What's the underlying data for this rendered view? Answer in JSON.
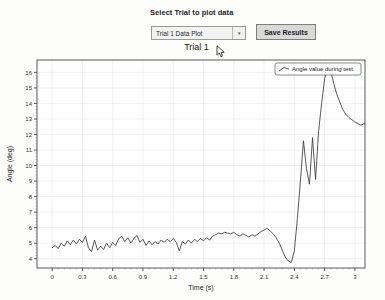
{
  "panel": {
    "select_label": "Select Trial to plot data",
    "dropdown_value": "Trial 1 Data Plot",
    "dropdown_arrow": "▾",
    "save_button_label": "Save Results"
  },
  "chart_data": {
    "type": "line",
    "title": "Trial 1",
    "xlabel": "Time (s)",
    "ylabel": "Angle (deg)",
    "xlim": [
      -0.15,
      3.1
    ],
    "ylim": [
      3.4,
      16.8
    ],
    "xticks": [
      0,
      0.3,
      0.6,
      0.9,
      1.2,
      1.5,
      1.8,
      2.1,
      2.4,
      2.7,
      3
    ],
    "xtick_labels": [
      "0",
      "0.3",
      "0.6",
      "0.9",
      "1.2",
      "1.5",
      "1.8",
      "2.1",
      "2.4",
      "2.7",
      "3"
    ],
    "yticks": [
      4,
      5,
      6,
      7,
      8,
      9,
      10,
      11,
      12,
      13,
      14,
      15,
      16
    ],
    "ytick_labels": [
      "4",
      "5",
      "6",
      "7",
      "8",
      "9",
      "10",
      "11",
      "12",
      "13",
      "14",
      "15",
      "16"
    ],
    "grid": true,
    "legend_position": "top-right",
    "series": [
      {
        "name": "Angle value during test",
        "color": "#3a3a3a",
        "x": [
          0.0,
          0.03,
          0.06,
          0.09,
          0.12,
          0.15,
          0.18,
          0.21,
          0.24,
          0.27,
          0.3,
          0.33,
          0.36,
          0.39,
          0.42,
          0.45,
          0.48,
          0.51,
          0.54,
          0.57,
          0.6,
          0.63,
          0.66,
          0.69,
          0.72,
          0.75,
          0.78,
          0.81,
          0.84,
          0.87,
          0.9,
          0.93,
          0.96,
          0.99,
          1.02,
          1.05,
          1.08,
          1.11,
          1.14,
          1.17,
          1.2,
          1.23,
          1.26,
          1.29,
          1.32,
          1.35,
          1.38,
          1.41,
          1.44,
          1.47,
          1.5,
          1.53,
          1.56,
          1.59,
          1.62,
          1.65,
          1.68,
          1.71,
          1.74,
          1.77,
          1.8,
          1.83,
          1.86,
          1.89,
          1.92,
          1.95,
          1.98,
          2.01,
          2.04,
          2.07,
          2.1,
          2.13,
          2.16,
          2.19,
          2.22,
          2.25,
          2.28,
          2.31,
          2.34,
          2.37,
          2.4,
          2.43,
          2.46,
          2.49,
          2.52,
          2.55,
          2.58,
          2.61,
          2.64,
          2.67,
          2.7,
          2.73,
          2.76,
          2.79,
          2.82,
          2.85,
          2.88,
          2.91,
          2.94,
          2.97,
          3.0
        ],
        "y": [
          4.7,
          4.85,
          4.65,
          5.0,
          4.8,
          5.15,
          4.9,
          5.2,
          4.95,
          5.25,
          5.05,
          5.45,
          4.7,
          4.45,
          5.2,
          4.55,
          4.8,
          4.6,
          5.0,
          4.7,
          5.05,
          4.85,
          5.3,
          5.45,
          5.1,
          5.35,
          5.0,
          5.3,
          5.5,
          5.05,
          5.25,
          4.85,
          5.15,
          4.9,
          5.1,
          4.95,
          5.2,
          5.05,
          5.25,
          5.1,
          5.3,
          5.05,
          4.5,
          5.1,
          4.95,
          5.2,
          5.0,
          5.25,
          5.1,
          5.3,
          5.15,
          5.35,
          5.2,
          5.45,
          5.55,
          5.65,
          5.6,
          5.7,
          5.65,
          5.6,
          5.7,
          5.55,
          5.45,
          5.6,
          5.5,
          5.4,
          5.55,
          5.45,
          5.6,
          5.75,
          5.85,
          5.95,
          5.8,
          5.6,
          5.35,
          5.0,
          4.55,
          4.1,
          3.85,
          3.75,
          4.5,
          6.6,
          9.0,
          11.6,
          9.8,
          8.8,
          11.8,
          9.1,
          12.2,
          14.0,
          15.6,
          16.3,
          16.1,
          15.3,
          14.6,
          14.1,
          13.6,
          13.3,
          13.1,
          12.95,
          12.8
        ]
      }
    ],
    "tail": {
      "x": [
        3.0,
        3.03,
        3.06,
        3.09,
        3.12,
        3.15,
        3.18,
        3.21,
        3.24,
        3.27,
        3.3
      ],
      "y": [
        12.8,
        12.7,
        12.6,
        12.7,
        12.6,
        12.5,
        12.4,
        12.45,
        12.4,
        12.35,
        12.4
      ]
    }
  }
}
